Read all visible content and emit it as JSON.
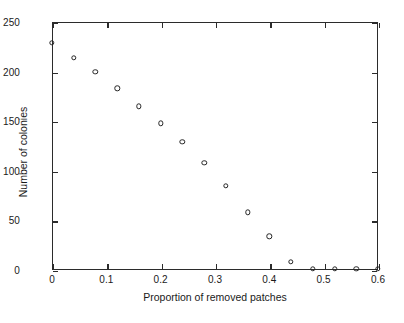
{
  "chart_data": {
    "type": "scatter",
    "title": "",
    "xlabel": "Proportion of removed patches",
    "ylabel": "Number of colonies",
    "xlim": [
      0,
      0.6
    ],
    "ylim": [
      0,
      250
    ],
    "xticks": [
      0,
      0.1,
      0.2,
      0.3,
      0.4,
      0.5,
      0.6
    ],
    "xticklabels": [
      "0",
      "0.1",
      "0.2",
      "0.3",
      "0.4",
      "0.5",
      "0.6"
    ],
    "yticks": [
      0,
      50,
      100,
      150,
      200,
      250
    ],
    "yticklabels": [
      "0",
      "50",
      "100",
      "150",
      "200",
      "250"
    ],
    "grid": false,
    "legend": null,
    "marker": "open-circle",
    "marker_color": "#242424",
    "x": [
      0.0,
      0.04,
      0.08,
      0.12,
      0.16,
      0.2,
      0.24,
      0.28,
      0.32,
      0.36,
      0.4,
      0.44,
      0.48,
      0.52,
      0.56,
      0.6
    ],
    "y": [
      229,
      214,
      200,
      183,
      165,
      148,
      129,
      108,
      85,
      58,
      34,
      8,
      1,
      1,
      1,
      1
    ],
    "points": [
      {
        "x": 0.0,
        "y": 229
      },
      {
        "x": 0.04,
        "y": 214
      },
      {
        "x": 0.08,
        "y": 200
      },
      {
        "x": 0.12,
        "y": 183
      },
      {
        "x": 0.16,
        "y": 165
      },
      {
        "x": 0.2,
        "y": 148
      },
      {
        "x": 0.24,
        "y": 129
      },
      {
        "x": 0.28,
        "y": 108
      },
      {
        "x": 0.32,
        "y": 85
      },
      {
        "x": 0.36,
        "y": 58
      },
      {
        "x": 0.4,
        "y": 34
      },
      {
        "x": 0.44,
        "y": 8
      },
      {
        "x": 0.48,
        "y": 1
      },
      {
        "x": 0.52,
        "y": 1
      },
      {
        "x": 0.56,
        "y": 1
      },
      {
        "x": 0.6,
        "y": 1
      }
    ]
  },
  "axis_color": "#2b2b2b"
}
